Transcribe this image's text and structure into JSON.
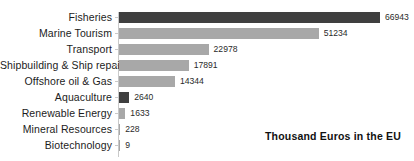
{
  "chart_data": {
    "type": "bar",
    "orientation": "horizontal",
    "title": "",
    "subtitle": "",
    "xlabel": "",
    "ylabel": "",
    "annotation": "Thousand Euros in the EU",
    "grid": false,
    "legend": "none",
    "xlim": [
      0,
      75000
    ],
    "categories": [
      "Fisheries",
      "Marine Tourism",
      "Transport",
      "Shipbuilding & Ship repair",
      "Offshore oil & Gas",
      "Aquaculture",
      "Renewable Energy",
      "Mineral Resources",
      "Biotechnology"
    ],
    "values": [
      66943,
      51234,
      22978,
      17891,
      14344,
      2640,
      1633,
      228,
      9
    ],
    "value_labels": [
      "66943",
      "51234",
      "22978",
      "17891",
      "14344",
      "2640",
      "1633",
      "228",
      "9"
    ],
    "bar_colors": [
      "#3f3f3f",
      "#a8a8a8",
      "#a8a8a8",
      "#a8a8a8",
      "#a8a8a8",
      "#3f3f3f",
      "#a8a8a8",
      "#a8a8a8",
      "#a8a8a8"
    ]
  },
  "colors": {
    "bar_light": "#a8a8a8",
    "bar_dark": "#3f3f3f",
    "axis": "#c9c9c9",
    "text": "#1c1c1c",
    "background": "#ffffff"
  }
}
